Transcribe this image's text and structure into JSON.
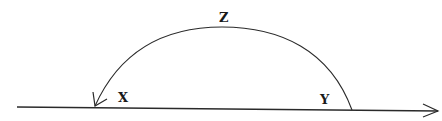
{
  "diagram": {
    "type": "arc-over-line",
    "labels": {
      "top": "Z",
      "left": "X",
      "right": "Y"
    },
    "colors": {
      "stroke": "#2a2a2a",
      "background": "#ffffff"
    },
    "baseline": {
      "arrow": "right"
    },
    "arc": {
      "from": "Y",
      "via": "Z",
      "to": "X",
      "arrow": "at-X"
    }
  }
}
